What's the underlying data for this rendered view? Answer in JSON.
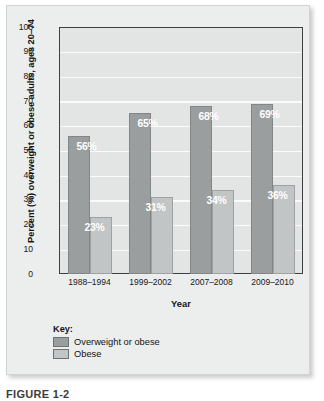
{
  "figure": {
    "caption": "FIGURE 1-2"
  },
  "chart_data": {
    "type": "bar",
    "title": "",
    "xlabel": "Year",
    "ylabel": "Percent (%) overweight or obese adults, ages 20–74",
    "categories": [
      "1988–1994",
      "1999–2002",
      "2007–2008",
      "2009–2010"
    ],
    "series": [
      {
        "name": "Overweight or obese",
        "values": [
          56,
          65,
          68,
          69
        ],
        "labels": [
          "56%",
          "65%",
          "68%",
          "69%"
        ],
        "color": "#9b9e9f"
      },
      {
        "name": "Obese",
        "values": [
          23,
          31,
          34,
          36
        ],
        "labels": [
          "23%",
          "31%",
          "34%",
          "36%"
        ],
        "color": "#c2c5c6"
      }
    ],
    "ylim": [
      0,
      100
    ],
    "ytick_step": 10,
    "yticks": [
      100,
      90,
      80,
      70,
      60,
      50,
      40,
      30,
      20,
      10,
      0
    ],
    "ytick_labels": [
      "100",
      "90",
      "80",
      "70",
      "60",
      "50",
      "40",
      "30",
      "20",
      "10",
      "0"
    ],
    "grid": true,
    "grid_color": "#fbfbfb",
    "plot_background": "#e3e4e4",
    "legend_position": "below-plot"
  },
  "legend": {
    "title": "Key:",
    "entries": [
      {
        "label": "Overweight or obese",
        "color": "#9b9e9f"
      },
      {
        "label": "Obese",
        "color": "#c2c5c6"
      }
    ]
  }
}
